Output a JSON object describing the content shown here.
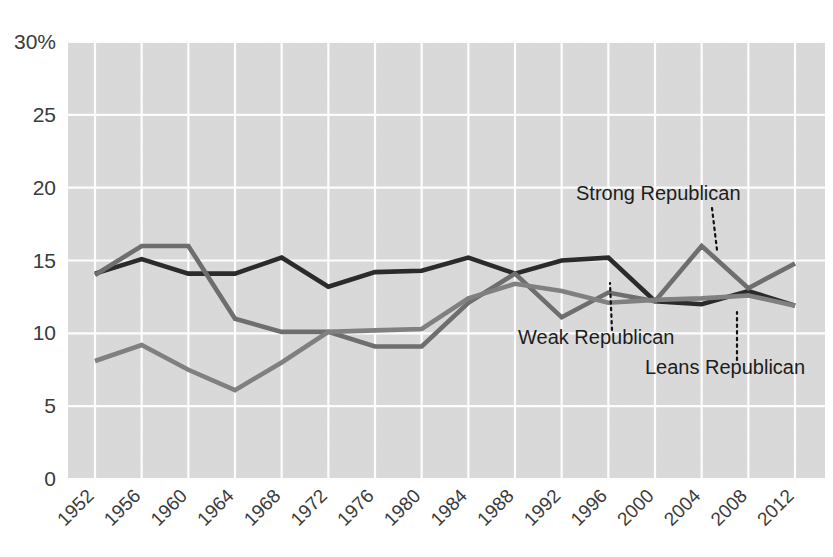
{
  "chart_data": {
    "type": "line",
    "title": "",
    "subtitle": "",
    "xlabel": "",
    "ylabel": "",
    "categories": [
      "1952",
      "1956",
      "1960",
      "1964",
      "1968",
      "1972",
      "1976",
      "1980",
      "1984",
      "1988",
      "1992",
      "1996",
      "2000",
      "2004",
      "2008",
      "2012"
    ],
    "x": [
      1952,
      1956,
      1960,
      1964,
      1968,
      1972,
      1976,
      1980,
      1984,
      1988,
      1992,
      1996,
      2000,
      2004,
      2008,
      2012
    ],
    "ylim": [
      0,
      30
    ],
    "y_ticks": [
      0,
      5,
      10,
      15,
      20,
      25,
      30
    ],
    "y_tick_labels": [
      "0",
      "5",
      "10",
      "15",
      "20",
      "25",
      "30%"
    ],
    "grid": true,
    "legend_position": "inline-annotations",
    "series": [
      {
        "name": "Weak Republican",
        "color": "#2b2b2b",
        "width": 4.6,
        "values": [
          14.1,
          15.1,
          14.1,
          14.1,
          15.2,
          13.2,
          14.2,
          14.3,
          15.2,
          14.1,
          15.0,
          15.2,
          12.2,
          12.0,
          12.9,
          11.9
        ]
      },
      {
        "name": "Strong Republican",
        "color": "#6e6e6e",
        "width": 4.6,
        "values": [
          14.0,
          16.0,
          16.0,
          11.0,
          10.1,
          10.1,
          9.1,
          9.1,
          12.1,
          14.1,
          11.1,
          12.8,
          12.2,
          16.0,
          13.1,
          14.8
        ]
      },
      {
        "name": "Leans Republican",
        "color": "#808080",
        "width": 4.6,
        "values": [
          8.1,
          9.2,
          7.5,
          6.1,
          8.0,
          10.1,
          10.2,
          10.3,
          12.4,
          13.4,
          12.9,
          12.1,
          12.3,
          12.4,
          12.6,
          11.9
        ]
      }
    ],
    "annotations": [
      {
        "name": "Strong Republican",
        "text": "Strong Republican",
        "label_x": 576,
        "label_y": 200,
        "anchor": "start",
        "leader": [
          [
            712,
            208
          ],
          [
            717,
            250
          ]
        ]
      },
      {
        "name": "Weak Republican",
        "text": "Weak Republican",
        "label_x": 518,
        "label_y": 344,
        "anchor": "start",
        "leader": [
          [
            612,
            330
          ],
          [
            610,
            283
          ]
        ]
      },
      {
        "name": "Leans Republican",
        "text": "Leans Republican",
        "label_x": 645,
        "label_y": 374,
        "anchor": "start",
        "leader": [
          [
            737,
            360
          ],
          [
            737,
            312
          ]
        ]
      }
    ],
    "colors": {
      "plot_background": "#d9d9d9",
      "gridline": "#fdfdfd",
      "page_background": "#ffffff",
      "text": "#3b3b3b"
    }
  }
}
